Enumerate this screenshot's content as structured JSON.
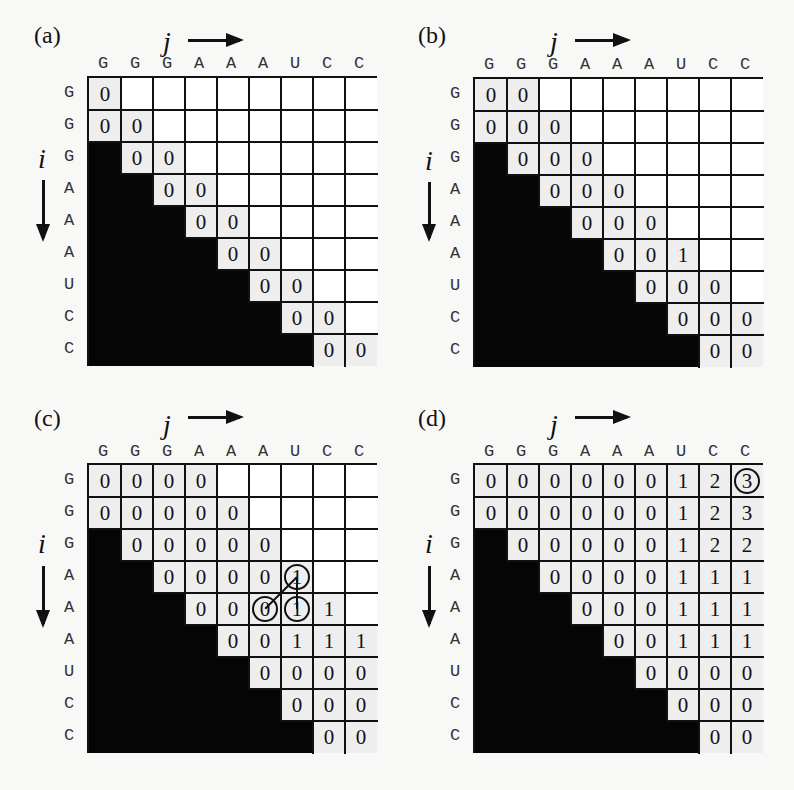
{
  "sequence": [
    "G",
    "G",
    "G",
    "A",
    "A",
    "A",
    "U",
    "C",
    "C"
  ],
  "axis": {
    "j_label": "j",
    "i_label": "i"
  },
  "panels": [
    {
      "id": "a",
      "label": "(a)",
      "grid": {
        "left": 87,
        "top": 76,
        "cell": 32
      },
      "label_pos": {
        "x": 34,
        "y": 23
      },
      "j_pos": {
        "x": 163,
        "y": 28
      },
      "j_arrow": {
        "x1": 188,
        "x2": 240,
        "y": 40
      },
      "col_label_y": 55,
      "i_pos": {
        "x": 38,
        "y": 145
      },
      "i_arrow": {
        "x": 43,
        "y1": 180,
        "y2": 238
      },
      "cells": [
        [
          "0",
          null,
          null,
          null,
          null,
          null,
          null,
          null,
          null
        ],
        [
          "0",
          "0",
          null,
          null,
          null,
          null,
          null,
          null,
          null
        ],
        [
          "#",
          "0",
          "0",
          null,
          null,
          null,
          null,
          null,
          null
        ],
        [
          "#",
          "#",
          "0",
          "0",
          null,
          null,
          null,
          null,
          null
        ],
        [
          "#",
          "#",
          "#",
          "0",
          "0",
          null,
          null,
          null,
          null
        ],
        [
          "#",
          "#",
          "#",
          "#",
          "0",
          "0",
          null,
          null,
          null
        ],
        [
          "#",
          "#",
          "#",
          "#",
          "#",
          "0",
          "0",
          null,
          null
        ],
        [
          "#",
          "#",
          "#",
          "#",
          "#",
          "#",
          "0",
          "0",
          null
        ],
        [
          "#",
          "#",
          "#",
          "#",
          "#",
          "#",
          "#",
          "0",
          "0"
        ]
      ],
      "circles": [],
      "connectors": []
    },
    {
      "id": "b",
      "label": "(b)",
      "grid": {
        "left": 473,
        "top": 77,
        "cell": 32
      },
      "label_pos": {
        "x": 418,
        "y": 23
      },
      "j_pos": {
        "x": 550,
        "y": 28
      },
      "j_arrow": {
        "x1": 575,
        "x2": 627,
        "y": 40
      },
      "col_label_y": 56,
      "i_pos": {
        "x": 425,
        "y": 147
      },
      "i_arrow": {
        "x": 429,
        "y1": 182,
        "y2": 238
      },
      "cells": [
        [
          "0",
          "0",
          null,
          null,
          null,
          null,
          null,
          null,
          null
        ],
        [
          "0",
          "0",
          "0",
          null,
          null,
          null,
          null,
          null,
          null
        ],
        [
          "#",
          "0",
          "0",
          "0",
          null,
          null,
          null,
          null,
          null
        ],
        [
          "#",
          "#",
          "0",
          "0",
          "0",
          null,
          null,
          null,
          null
        ],
        [
          "#",
          "#",
          "#",
          "0",
          "0",
          "0",
          null,
          null,
          null
        ],
        [
          "#",
          "#",
          "#",
          "#",
          "0",
          "0",
          "1",
          null,
          null
        ],
        [
          "#",
          "#",
          "#",
          "#",
          "#",
          "0",
          "0",
          "0",
          null
        ],
        [
          "#",
          "#",
          "#",
          "#",
          "#",
          "#",
          "0",
          "0",
          "0"
        ],
        [
          "#",
          "#",
          "#",
          "#",
          "#",
          "#",
          "#",
          "0",
          "0"
        ]
      ],
      "circles": [],
      "connectors": []
    },
    {
      "id": "c",
      "label": "(c)",
      "grid": {
        "left": 87,
        "top": 463,
        "cell": 32
      },
      "label_pos": {
        "x": 34,
        "y": 406
      },
      "j_pos": {
        "x": 163,
        "y": 411
      },
      "j_arrow": {
        "x1": 188,
        "x2": 240,
        "y": 417
      },
      "col_label_y": 443,
      "i_pos": {
        "x": 38,
        "y": 530
      },
      "i_arrow": {
        "x": 43,
        "y1": 566,
        "y2": 624
      },
      "cells": [
        [
          "0",
          "0",
          "0",
          "0",
          null,
          null,
          null,
          null,
          null
        ],
        [
          "0",
          "0",
          "0",
          "0",
          "0",
          null,
          null,
          null,
          null
        ],
        [
          "#",
          "0",
          "0",
          "0",
          "0",
          "0",
          null,
          null,
          null
        ],
        [
          "#",
          "#",
          "0",
          "0",
          "0",
          "0",
          "1",
          null,
          null
        ],
        [
          "#",
          "#",
          "#",
          "0",
          "0",
          "0",
          "1",
          "1",
          null
        ],
        [
          "#",
          "#",
          "#",
          "#",
          "0",
          "0",
          "1",
          "1",
          "1"
        ],
        [
          "#",
          "#",
          "#",
          "#",
          "#",
          "0",
          "0",
          "0",
          "0"
        ],
        [
          "#",
          "#",
          "#",
          "#",
          "#",
          "#",
          "0",
          "0",
          "0"
        ],
        [
          "#",
          "#",
          "#",
          "#",
          "#",
          "#",
          "#",
          "0",
          "0"
        ]
      ],
      "circles": [
        [
          3,
          6
        ],
        [
          4,
          5
        ],
        [
          4,
          6
        ]
      ],
      "connectors": [
        [
          [
            3,
            6
          ],
          [
            4,
            5
          ]
        ],
        [
          [
            3,
            6
          ],
          [
            4,
            6
          ]
        ]
      ]
    },
    {
      "id": "d",
      "label": "(d)",
      "grid": {
        "left": 473,
        "top": 463,
        "cell": 32
      },
      "label_pos": {
        "x": 418,
        "y": 406
      },
      "j_pos": {
        "x": 550,
        "y": 411
      },
      "j_arrow": {
        "x1": 575,
        "x2": 627,
        "y": 417
      },
      "col_label_y": 443,
      "i_pos": {
        "x": 425,
        "y": 530
      },
      "i_arrow": {
        "x": 429,
        "y1": 566,
        "y2": 624
      },
      "cells": [
        [
          "0",
          "0",
          "0",
          "0",
          "0",
          "0",
          "1",
          "2",
          "3"
        ],
        [
          "0",
          "0",
          "0",
          "0",
          "0",
          "0",
          "1",
          "2",
          "3"
        ],
        [
          "#",
          "0",
          "0",
          "0",
          "0",
          "0",
          "1",
          "2",
          "2"
        ],
        [
          "#",
          "#",
          "0",
          "0",
          "0",
          "0",
          "1",
          "1",
          "1"
        ],
        [
          "#",
          "#",
          "#",
          "0",
          "0",
          "0",
          "1",
          "1",
          "1"
        ],
        [
          "#",
          "#",
          "#",
          "#",
          "0",
          "0",
          "1",
          "1",
          "1"
        ],
        [
          "#",
          "#",
          "#",
          "#",
          "#",
          "0",
          "0",
          "0",
          "0"
        ],
        [
          "#",
          "#",
          "#",
          "#",
          "#",
          "#",
          "0",
          "0",
          "0"
        ],
        [
          "#",
          "#",
          "#",
          "#",
          "#",
          "#",
          "#",
          "0",
          "0"
        ]
      ],
      "circles": [
        [
          0,
          8
        ]
      ],
      "connectors": []
    }
  ],
  "colors": {
    "line": "#111111",
    "filled_cell": "#eeeeee",
    "empty_cell": "#ffffff",
    "lower_triangle": "#050505",
    "background": "#f8f8f6"
  }
}
